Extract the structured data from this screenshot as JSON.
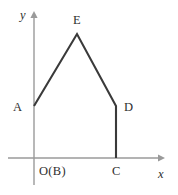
{
  "figure": {
    "type": "geometry-diagram",
    "background_color": "#ffffff",
    "axis_color": "#9a9a9a",
    "polyline_color": "#3a3a3a",
    "axes": {
      "x_axis_label": "x",
      "y_axis_label": "y",
      "x_axis_y_pixel": 158,
      "y_axis_x_pixel": 34,
      "x_axis_from_x": 8,
      "x_axis_to_x": 163,
      "y_axis_from_y": 12,
      "y_axis_to_y": 185,
      "x_arrow": "right-arrowhead",
      "y_arrow": "up-arrowhead",
      "grid": false
    },
    "points": [
      {
        "id": "A",
        "label": "A",
        "x": 34,
        "y": 106,
        "label_x": 13,
        "label_y": 101,
        "note": "on y-axis"
      },
      {
        "id": "E",
        "label": "E",
        "x": 77,
        "y": 34,
        "label_x": 73,
        "label_y": 14,
        "note": "apex"
      },
      {
        "id": "D",
        "label": "D",
        "x": 116,
        "y": 106,
        "label_x": 124,
        "label_y": 101,
        "note": "right shoulder"
      },
      {
        "id": "C",
        "label": "C",
        "x": 116,
        "y": 158,
        "label_x": 112,
        "label_y": 165,
        "note": "on x-axis"
      },
      {
        "id": "OB",
        "label": "O(B)",
        "x": 34,
        "y": 158,
        "label_x": 39,
        "label_y": 165,
        "note": "origin, coincides with B"
      }
    ],
    "polyline": {
      "vertices": [
        "A",
        "E",
        "D",
        "C"
      ],
      "path_points": [
        [
          34,
          106
        ],
        [
          77,
          34
        ],
        [
          116,
          106
        ],
        [
          116,
          158
        ]
      ],
      "closed": false
    },
    "segments": [
      {
        "name": "segment-ae",
        "from": "A",
        "to": "E"
      },
      {
        "name": "segment-ed",
        "from": "E",
        "to": "D"
      },
      {
        "name": "segment-dc",
        "from": "D",
        "to": "C"
      }
    ]
  }
}
